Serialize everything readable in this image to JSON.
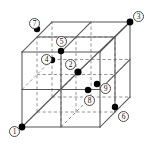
{
  "figure": {
    "width": 155,
    "height": 144,
    "background_color": "#ffffff",
    "solid_edge_color": "#555555",
    "hidden_edge_color": "#888888",
    "node_color": "#000000",
    "label_ring_color": "#4a4a4a",
    "label_text_color": "#111111"
  },
  "cube": {
    "type": "wireframe-2x2x2-subdivided",
    "front_face": {
      "left": 22,
      "top": 52,
      "right": 100,
      "bottom": 127
    },
    "depth_offset": {
      "dx": 30,
      "dy": -30
    },
    "divisions": 2,
    "vertices": [
      {
        "name": "front-bottom-left",
        "x": 22,
        "y": 127
      },
      {
        "name": "front-bottom-right",
        "x": 100,
        "y": 127
      },
      {
        "name": "front-top-right",
        "x": 100,
        "y": 52
      },
      {
        "name": "front-top-left",
        "x": 22,
        "y": 52
      },
      {
        "name": "back-bottom-left",
        "x": 52,
        "y": 97
      },
      {
        "name": "back-bottom-right",
        "x": 130,
        "y": 97
      },
      {
        "name": "back-top-right",
        "x": 130,
        "y": 22
      },
      {
        "name": "back-top-left",
        "x": 52,
        "y": 22
      }
    ]
  },
  "nodes": [
    {
      "id": 1,
      "label": "1",
      "node_x": 22,
      "node_y": 127,
      "label_x": 9,
      "label_y": 126,
      "description": "front-bottom-left corner"
    },
    {
      "id": 2,
      "label": "2",
      "node_x": 78,
      "node_y": 72,
      "label_x": 65,
      "label_y": 59,
      "description": "cube center"
    },
    {
      "id": 3,
      "label": "3",
      "node_x": 130,
      "node_y": 22,
      "label_x": 133,
      "label_y": 11,
      "description": "back-top-right corner"
    },
    {
      "id": 4,
      "label": "4",
      "node_x": 52,
      "node_y": 60,
      "label_x": 41,
      "label_y": 54,
      "description": "upper-left interior node"
    },
    {
      "id": 5,
      "label": "5",
      "node_x": 61,
      "node_y": 51,
      "label_x": 56,
      "label_y": 36,
      "description": "top-face mid node"
    },
    {
      "id": 6,
      "label": "6",
      "node_x": 115,
      "node_y": 107,
      "label_x": 118,
      "label_y": 111,
      "description": "lower-right node"
    },
    {
      "id": 7,
      "label": "7",
      "node_x": 37,
      "node_y": 29,
      "label_x": 29,
      "label_y": 18,
      "description": "back-top-left area node"
    },
    {
      "id": 8,
      "label": "8",
      "node_x": 88,
      "node_y": 90,
      "label_x": 84,
      "label_y": 95,
      "description": "lower-middle interior node"
    },
    {
      "id": 9,
      "label": "9",
      "node_x": 97,
      "node_y": 84,
      "label_x": 100,
      "label_y": 83,
      "description": "right-of-center node"
    }
  ],
  "path": {
    "name": "diagonal-traversal",
    "order": [
      1,
      2,
      3
    ],
    "style": "solid-thin"
  }
}
